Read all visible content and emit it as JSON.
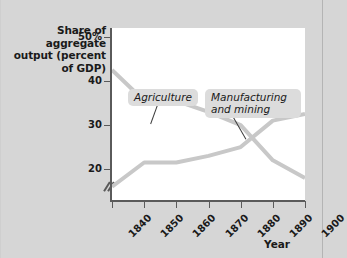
{
  "figure": {
    "y_axis_title": "Share of aggregate output (percent of GDP)",
    "x_axis_title": "Year"
  },
  "callouts": {
    "agriculture": "Agriculture",
    "manufacturing": "Manufacturing and mining"
  },
  "chart_data": {
    "type": "line",
    "title": "",
    "xlabel": "Year",
    "ylabel": "Share of aggregate output (percent of GDP)",
    "x": [
      1840,
      1850,
      1860,
      1870,
      1880,
      1890,
      1900
    ],
    "xtick_labels": [
      "1840",
      "1850",
      "1860",
      "1870",
      "1880",
      "1890",
      "1900"
    ],
    "ytick_labels": [
      "50%",
      "40",
      "30",
      "20"
    ],
    "ytick_values": [
      50,
      40,
      30,
      20
    ],
    "xlim": [
      1840,
      1900
    ],
    "ylim": [
      13,
      52
    ],
    "y_axis_break": true,
    "grid": false,
    "legend_position": "inline-callout",
    "line_color": "#c8c8c8",
    "line_width": 4,
    "series": [
      {
        "name": "Agriculture",
        "values": [
          42.5,
          35.5,
          35.5,
          33.0,
          30.0,
          22.0,
          18.0
        ]
      },
      {
        "name": "Manufacturing and mining",
        "values": [
          16.0,
          21.5,
          21.5,
          23.0,
          25.0,
          31.0,
          32.5
        ]
      }
    ]
  }
}
